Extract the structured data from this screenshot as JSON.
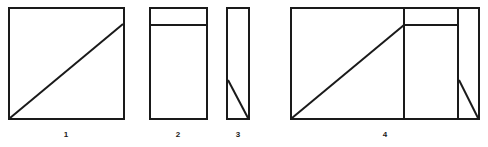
{
  "figure": {
    "stroke_color": "#1a1a1a",
    "fill_color": "#ffffff",
    "background_color": "#ffffff",
    "panels": [
      {
        "id": "panel-1",
        "caption": "1",
        "shape": "square-with-diagonal",
        "caption_x": 66,
        "caption_y": 137,
        "rect": {
          "x": 9,
          "y": 8,
          "width": 115,
          "height": 111
        },
        "lines": [
          {
            "name": "diagonal",
            "x1": 10,
            "y1": 118,
            "x2": 123,
            "y2": 24
          }
        ]
      },
      {
        "id": "panel-2",
        "caption": "2",
        "shape": "rectangle-with-top-band",
        "caption_x": 178,
        "caption_y": 137,
        "rect": {
          "x": 150,
          "y": 8,
          "width": 57,
          "height": 111
        },
        "lines": [
          {
            "name": "horizontal-divider",
            "x1": 150,
            "y1": 25,
            "x2": 207,
            "y2": 25
          }
        ]
      },
      {
        "id": "panel-3",
        "caption": "3",
        "shape": "narrow-rectangle-with-lower-diagonal",
        "caption_x": 238,
        "caption_y": 137,
        "rect": {
          "x": 227,
          "y": 8,
          "width": 22,
          "height": 111
        },
        "lines": [
          {
            "name": "lower-diagonal",
            "x1": 228,
            "y1": 80,
            "x2": 248,
            "y2": 118
          }
        ]
      },
      {
        "id": "panel-4",
        "caption": "4",
        "shape": "composite-rectangle",
        "caption_x": 385,
        "caption_y": 137,
        "rect": {
          "x": 291,
          "y": 8,
          "width": 188,
          "height": 111
        },
        "lines": [
          {
            "name": "vertical-divider-left",
            "x1": 404,
            "y1": 8,
            "x2": 404,
            "y2": 119
          },
          {
            "name": "vertical-divider-right",
            "x1": 458,
            "y1": 8,
            "x2": 458,
            "y2": 119
          },
          {
            "name": "horizontal-band",
            "x1": 404,
            "y1": 25,
            "x2": 458,
            "y2": 25
          },
          {
            "name": "main-diagonal",
            "x1": 292,
            "y1": 118,
            "x2": 404,
            "y2": 25
          },
          {
            "name": "small-diagonal",
            "x1": 459,
            "y1": 80,
            "x2": 478,
            "y2": 118
          }
        ]
      }
    ]
  }
}
